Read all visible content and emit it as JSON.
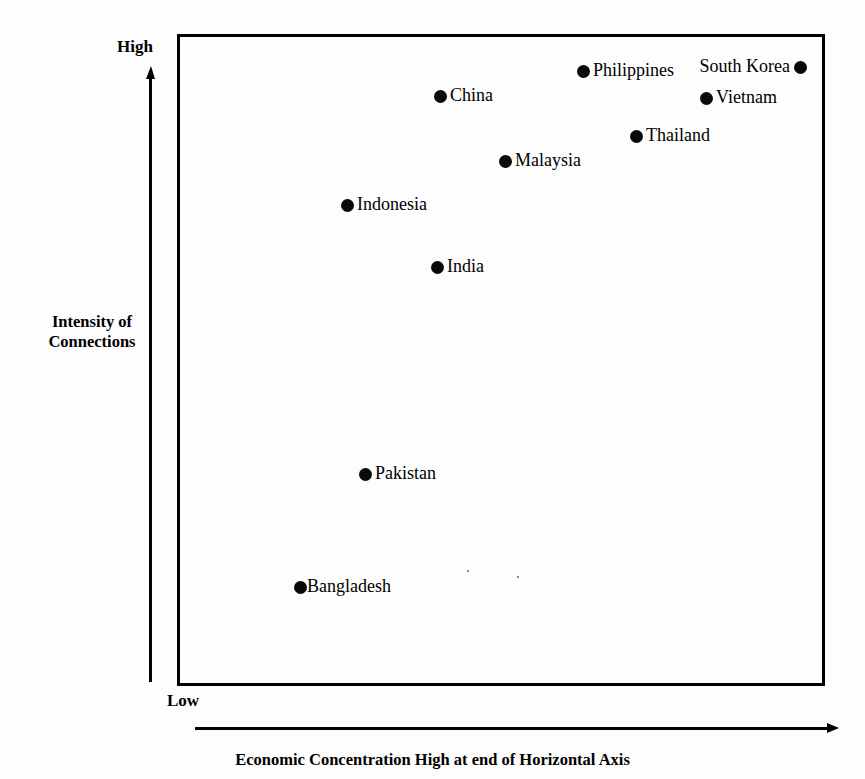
{
  "chart_data": {
    "type": "scatter",
    "title": "",
    "xlabel": "Economic Concentration High at end of Horizontal Axis",
    "ylabel": "Intensity of Connections",
    "y_axis_top_label": "High",
    "y_axis_bottom_label": "Low",
    "xlim": [
      0,
      100
    ],
    "ylim": [
      0,
      100
    ],
    "grid": false,
    "legend": "none",
    "axis_style": "qualitative-arrows",
    "points": [
      {
        "label": "South Korea",
        "x": 96.0,
        "y": 95.1,
        "label_side": "left",
        "px": 800,
        "py": 67
      },
      {
        "label": "Philippines",
        "x": 62.7,
        "y": 94.5,
        "label_side": "right",
        "px": 583,
        "py": 71
      },
      {
        "label": "China",
        "x": 40.6,
        "y": 90.5,
        "label_side": "right",
        "px": 440,
        "py": 96
      },
      {
        "label": "Vietnam",
        "x": 81.6,
        "y": 90.2,
        "label_side": "right",
        "px": 706,
        "py": 98
      },
      {
        "label": "Thailand",
        "x": 70.8,
        "y": 84.4,
        "label_side": "right",
        "px": 636,
        "py": 136
      },
      {
        "label": "Malaysia",
        "x": 50.6,
        "y": 80.5,
        "label_side": "right",
        "px": 505,
        "py": 161
      },
      {
        "label": "Indonesia",
        "x": 26.2,
        "y": 73.8,
        "label_side": "right",
        "px": 347,
        "py": 205
      },
      {
        "label": "India",
        "x": 40.1,
        "y": 64.3,
        "label_side": "right",
        "px": 437,
        "py": 267
      },
      {
        "label": "Pakistan",
        "x": 29.0,
        "y": 32.5,
        "label_side": "right",
        "px": 365,
        "py": 474
      },
      {
        "label": "Bangladesh",
        "x": 19.0,
        "y": 15.2,
        "label_side": "right",
        "px": 300,
        "py": 587
      }
    ]
  },
  "colors": {
    "point": "#0a0a0a",
    "frame": "#000000",
    "background": "#fdfdfd",
    "text": "#000000"
  }
}
